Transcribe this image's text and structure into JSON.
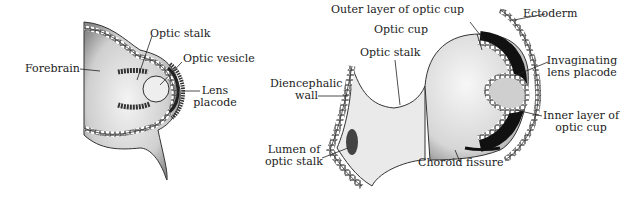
{
  "figure": {
    "left_panel": {
      "labels": {
        "forebrain": "Forebrain",
        "optic_stalk": "Optic stalk",
        "optic_vesicle": "Optic vesicle",
        "lens_placode_1": "Lens",
        "lens_placode_2": "placode"
      }
    },
    "right_panel": {
      "labels": {
        "outer_layer": "Outer layer of optic cup",
        "optic_cup": "Optic cup",
        "optic_stalk": "Optic stalk",
        "diencephalic_1": "Diencephalic",
        "diencephalic_2": "wall",
        "lumen_1": "Lumen of",
        "lumen_2": "optic stalk",
        "choroid_fissure": "Choroid fissure",
        "ectoderm": "Ectoderm",
        "invaginating_1": "Invaginating",
        "invaginating_2": "lens placode",
        "inner_layer_1": "Inner layer of",
        "inner_layer_2": "optic cup"
      }
    },
    "colors": {
      "ink": "#222222",
      "stipple": "#bdbdbd",
      "dark": "#1a1a1a",
      "background": "#ffffff"
    }
  }
}
